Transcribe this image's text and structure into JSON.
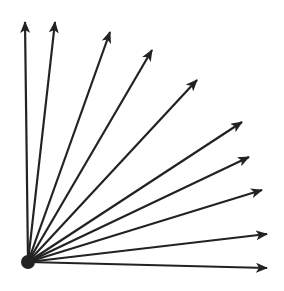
{
  "diagram": {
    "stroke_color": "#222222",
    "background": "#ffffff",
    "origin": {
      "x": 28,
      "y": 262,
      "r": 7
    },
    "arrows": [
      {
        "id": 1,
        "x2": 25,
        "y2": 22
      },
      {
        "id": 2,
        "x2": 55,
        "y2": 22
      },
      {
        "id": 3,
        "x2": 110,
        "y2": 32
      },
      {
        "id": 4,
        "x2": 152,
        "y2": 50
      },
      {
        "id": 5,
        "x2": 197,
        "y2": 80
      },
      {
        "id": 6,
        "x2": 242,
        "y2": 122
      },
      {
        "id": 7,
        "x2": 249,
        "y2": 157
      },
      {
        "id": 8,
        "x2": 262,
        "y2": 190
      },
      {
        "id": 9,
        "x2": 267,
        "y2": 234
      },
      {
        "id": 10,
        "x2": 267,
        "y2": 268
      }
    ]
  }
}
